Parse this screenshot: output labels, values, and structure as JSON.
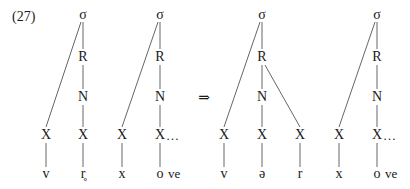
{
  "example_number": "(27)",
  "arrow": "⇒",
  "trees": [
    {
      "name": "before-1",
      "sigma": "σ",
      "rhyme": "R",
      "nucleus": "N",
      "slots": [
        {
          "label": "X",
          "segment": "v"
        },
        {
          "label": "X",
          "segment": "r̥"
        }
      ]
    },
    {
      "name": "before-2",
      "sigma": "σ",
      "rhyme": "R",
      "nucleus": "N",
      "slots": [
        {
          "label": "X",
          "segment": "x"
        },
        {
          "label": "X",
          "segment": "o",
          "trail": "…",
          "segment_tail": "ve"
        }
      ]
    },
    {
      "name": "after-1",
      "sigma": "σ",
      "rhyme": "R",
      "nucleus": "N",
      "slots": [
        {
          "label": "X",
          "segment": "v"
        },
        {
          "label": "X",
          "segment": "ə"
        },
        {
          "label": "X",
          "segment": "r"
        }
      ]
    },
    {
      "name": "after-2",
      "sigma": "σ",
      "rhyme": "R",
      "nucleus": "N",
      "slots": [
        {
          "label": "X",
          "segment": "x"
        },
        {
          "label": "X",
          "segment": "o",
          "trail": "…",
          "segment_tail": "ve"
        }
      ]
    }
  ],
  "colors": {
    "line": "#555555",
    "text": "#1a1a1a"
  }
}
